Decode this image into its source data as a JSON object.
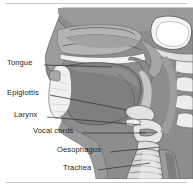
{
  "figure": {
    "orientation": "left-facing head and neck, midsagittal cut",
    "background_color": "#ffffff",
    "rule_color": "#c9c9c9",
    "text_color": "#1d1d1d"
  },
  "palette": {
    "tissue_mid": "#8d8d8d",
    "tissue_dark": "#6f6f6f",
    "tissue_light": "#a9a9a9",
    "tissue_pale": "#c2c2c2",
    "cartilage": "#e8e8e8",
    "bone_white": "#f4f4f4",
    "airway_white": "#ffffff",
    "outline": "#4a4a4a",
    "leader_line": "#2b2b2b"
  },
  "labels": [
    {
      "id": "tongue",
      "text": "Tongue",
      "text_x": 7,
      "text_y": 59,
      "leader_from_x": 44,
      "leader_from_y": 65,
      "leader_to_x": 112,
      "leader_to_y": 67
    },
    {
      "id": "epiglottis",
      "text": "Epiglottis",
      "text_x": 7,
      "text_y": 89,
      "leader_from_x": 50,
      "leader_from_y": 95,
      "leader_to_x": 127,
      "leader_to_y": 110
    },
    {
      "id": "larynx",
      "text": "Larynx",
      "text_x": 14,
      "text_y": 111,
      "leader_from_x": 47,
      "leader_from_y": 117,
      "leader_to_x": 141,
      "leader_to_y": 125
    },
    {
      "id": "vocal-cords",
      "text": "Vocal cords",
      "text_x": 33,
      "text_y": 127,
      "leader_from_x": 82,
      "leader_from_y": 133,
      "leader_to_x": 146,
      "leader_to_y": 133
    },
    {
      "id": "oesophagus",
      "text": "Oesophagus",
      "text_x": 57,
      "text_y": 146,
      "leader_from_x": 110,
      "leader_from_y": 152,
      "leader_to_x": 160,
      "leader_to_y": 147
    },
    {
      "id": "trachea",
      "text": "Trachea",
      "text_x": 63,
      "text_y": 164,
      "leader_from_x": 98,
      "leader_from_y": 170,
      "leader_to_x": 150,
      "leader_to_y": 163
    }
  ],
  "structures": [
    "nasal cavity",
    "nasal turbinates",
    "hard palate",
    "soft palate",
    "tongue",
    "mandible",
    "epiglottis",
    "larynx",
    "vocal cords",
    "oesophagus",
    "trachea",
    "cervical vertebrae",
    "skull base"
  ]
}
